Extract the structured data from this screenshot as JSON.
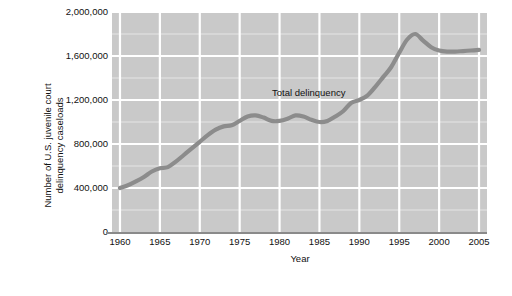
{
  "chart_data": {
    "type": "line",
    "title": "",
    "xlabel": "Year",
    "ylabel": "Number of U.S. juvenile court delinquency caseloads",
    "ylabel_line1": "Number of U.S. juvenile court",
    "ylabel_line2": "delinquency caseloads",
    "xlim": [
      1959,
      2006
    ],
    "ylim": [
      0,
      2000000
    ],
    "grid": true,
    "legend_position": "inline-annotation",
    "y_ticks": [
      0,
      400000,
      800000,
      1200000,
      1600000,
      2000000
    ],
    "y_tick_labels": [
      "0",
      "400,000",
      "800,000",
      "1,200,000",
      "1,600,000",
      "2,000,000"
    ],
    "y_minor_ticks": [
      200000,
      600000,
      1000000,
      1400000,
      1800000
    ],
    "x_ticks": [
      1960,
      1965,
      1970,
      1975,
      1980,
      1985,
      1990,
      1995,
      2000,
      2005
    ],
    "x_tick_labels": [
      "1960",
      "1965",
      "1970",
      "1975",
      "1980",
      "1985",
      "1990",
      "1995",
      "2000",
      "2005"
    ],
    "series": [
      {
        "name": "Total delinquency",
        "color": "#8c8c8c",
        "annotation": "Total delinquency",
        "x": [
          1960,
          1961,
          1962,
          1963,
          1964,
          1965,
          1966,
          1967,
          1968,
          1969,
          1970,
          1971,
          1972,
          1973,
          1974,
          1975,
          1976,
          1977,
          1978,
          1979,
          1980,
          1981,
          1982,
          1983,
          1984,
          1985,
          1986,
          1987,
          1988,
          1989,
          1990,
          1991,
          1992,
          1993,
          1994,
          1995,
          1996,
          1997,
          1998,
          1999,
          2000,
          2001,
          2002,
          2003,
          2004,
          2005
        ],
        "values": [
          400000,
          425000,
          460000,
          500000,
          550000,
          580000,
          590000,
          640000,
          700000,
          760000,
          820000,
          880000,
          930000,
          960000,
          970000,
          1010000,
          1050000,
          1060000,
          1040000,
          1010000,
          1010000,
          1030000,
          1060000,
          1050000,
          1020000,
          1000000,
          1010000,
          1050000,
          1100000,
          1175000,
          1200000,
          1240000,
          1320000,
          1410000,
          1500000,
          1630000,
          1750000,
          1800000,
          1740000,
          1680000,
          1650000,
          1640000,
          1640000,
          1645000,
          1650000,
          1655000
        ]
      }
    ],
    "colors": {
      "plot_background": "#c9c9c9",
      "gridline": "#ffffff",
      "line": "#8c8c8c",
      "text": "#111111",
      "axis": "#8a8a8a",
      "page_background": "#ffffff"
    }
  }
}
